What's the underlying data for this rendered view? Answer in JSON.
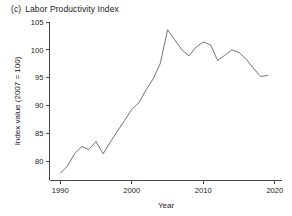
{
  "figure": {
    "panel_tag": "(c)",
    "panel_title": "Labor Productivity Index"
  },
  "chart_data": {
    "type": "line",
    "xlabel": "Year",
    "ylabel": "Index value (2007 = 100)",
    "xlim": [
      1988.5,
      2021
    ],
    "ylim": [
      76.5,
      105.5
    ],
    "xticks": [
      1990,
      2000,
      2010,
      2020
    ],
    "yticks": [
      80,
      85,
      90,
      95,
      100,
      105
    ],
    "xtick_labels": [
      "1990",
      "2000",
      "2010",
      "2020"
    ],
    "ytick_labels": [
      "80",
      "85",
      "90",
      "95",
      "100",
      "105"
    ],
    "grid": false,
    "legend": false,
    "line_color": "#5a5a5a",
    "series": [
      {
        "name": "Labor Productivity Index",
        "x": [
          1990,
          1991,
          1992,
          1993,
          1994,
          1995,
          1996,
          1997,
          1998,
          1999,
          2000,
          2001,
          2002,
          2003,
          2004,
          2005,
          2006,
          2007,
          2008,
          2009,
          2010,
          2011,
          2012,
          2013,
          2014,
          2015,
          2016,
          2017,
          2018,
          2019
        ],
        "values": [
          77.8,
          79.1,
          81.3,
          82.6,
          82.1,
          83.5,
          81.3,
          83.4,
          85.4,
          87.3,
          89.3,
          90.5,
          92.8,
          94.8,
          97.6,
          103.6,
          101.8,
          100.0,
          98.9,
          100.5,
          101.4,
          100.9,
          98.1,
          99.0,
          100.0,
          99.5,
          98.3,
          96.7,
          95.2,
          95.4
        ]
      }
    ]
  },
  "axes": {
    "x_title": "Year",
    "y_title": "Index value (2007 = 100)"
  }
}
